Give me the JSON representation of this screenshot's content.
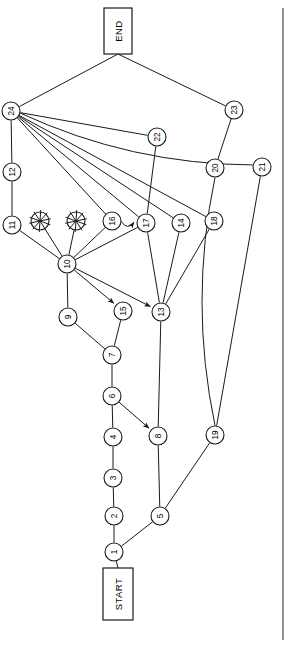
{
  "figure": {
    "type": "directed-graph-flowchart",
    "orientation": "rotated-90-ccw",
    "background": "#ffffff",
    "stroke_color": "#1a1a1a",
    "width": 291,
    "height": 645
  },
  "terminals": {
    "start": {
      "label": "START",
      "x": 118,
      "y": 594,
      "w": 30,
      "h": 52
    },
    "end": {
      "label": "END",
      "x": 118,
      "y": 31,
      "w": 28,
      "h": 46
    }
  },
  "nodes": [
    {
      "id": "1",
      "label": "1",
      "x": 114,
      "y": 552,
      "r": 9
    },
    {
      "id": "2",
      "label": "2",
      "x": 114,
      "y": 516,
      "r": 9
    },
    {
      "id": "3",
      "label": "3",
      "x": 113,
      "y": 478,
      "r": 9
    },
    {
      "id": "4",
      "label": "4",
      "x": 113,
      "y": 437,
      "r": 9
    },
    {
      "id": "5",
      "label": "5",
      "x": 160,
      "y": 516,
      "r": 9
    },
    {
      "id": "6",
      "label": "6",
      "x": 112,
      "y": 396,
      "r": 9
    },
    {
      "id": "7",
      "label": "7",
      "x": 112,
      "y": 355,
      "r": 9
    },
    {
      "id": "8",
      "label": "8",
      "x": 158,
      "y": 436,
      "r": 9
    },
    {
      "id": "9",
      "label": "9",
      "x": 68,
      "y": 317,
      "r": 9
    },
    {
      "id": "10",
      "label": "10",
      "x": 67,
      "y": 264,
      "r": 9
    },
    {
      "id": "11",
      "label": "11",
      "x": 12,
      "y": 225,
      "r": 9
    },
    {
      "id": "12",
      "label": "12",
      "x": 12,
      "y": 172,
      "r": 9
    },
    {
      "id": "13",
      "label": "13",
      "x": 161,
      "y": 312,
      "r": 9
    },
    {
      "id": "14",
      "label": "14",
      "x": 181,
      "y": 223,
      "r": 9
    },
    {
      "id": "15",
      "label": "15",
      "x": 123,
      "y": 311,
      "r": 9
    },
    {
      "id": "16",
      "label": "16",
      "x": 112,
      "y": 221,
      "r": 9
    },
    {
      "id": "17",
      "label": "17",
      "x": 146,
      "y": 223,
      "r": 9
    },
    {
      "id": "18",
      "label": "18",
      "x": 214,
      "y": 221,
      "r": 9
    },
    {
      "id": "19",
      "label": "19",
      "x": 215,
      "y": 435,
      "r": 9
    },
    {
      "id": "20",
      "label": "20",
      "x": 215,
      "y": 168,
      "r": 9
    },
    {
      "id": "21",
      "label": "21",
      "x": 262,
      "y": 167,
      "r": 9
    },
    {
      "id": "22",
      "label": "22",
      "x": 157,
      "y": 137,
      "r": 9
    },
    {
      "id": "23",
      "label": "23",
      "x": 234,
      "y": 110,
      "r": 9
    },
    {
      "id": "24",
      "label": "24",
      "x": 11,
      "y": 111,
      "r": 9
    },
    {
      "id": "u1",
      "label": "",
      "x": 40,
      "y": 221,
      "r": 9,
      "obscured": true
    },
    {
      "id": "u2",
      "label": "",
      "x": 76,
      "y": 221,
      "r": 9,
      "obscured": true
    }
  ],
  "edges": [
    {
      "from": "START",
      "to": "1",
      "type": "line"
    },
    {
      "from": "1",
      "to": "2",
      "type": "line"
    },
    {
      "from": "2",
      "to": "3",
      "type": "line"
    },
    {
      "from": "3",
      "to": "4",
      "type": "line"
    },
    {
      "from": "4",
      "to": "6",
      "type": "line"
    },
    {
      "from": "6",
      "to": "7",
      "type": "line"
    },
    {
      "from": "6",
      "to": "8",
      "type": "arrow"
    },
    {
      "from": "1",
      "to": "5",
      "type": "line"
    },
    {
      "from": "5",
      "to": "8",
      "type": "line"
    },
    {
      "from": "5",
      "to": "19",
      "type": "line"
    },
    {
      "from": "7",
      "to": "9",
      "type": "line"
    },
    {
      "from": "7",
      "to": "15",
      "type": "line"
    },
    {
      "from": "9",
      "to": "10",
      "type": "line"
    },
    {
      "from": "8",
      "to": "13",
      "type": "line"
    },
    {
      "from": "10",
      "to": "11",
      "type": "line"
    },
    {
      "from": "10",
      "to": "u1",
      "type": "line"
    },
    {
      "from": "10",
      "to": "u2",
      "type": "line"
    },
    {
      "from": "10",
      "to": "16",
      "type": "line"
    },
    {
      "from": "10",
      "to": "17",
      "type": "line"
    },
    {
      "from": "10",
      "to": "15",
      "type": "arrow"
    },
    {
      "from": "10",
      "to": "13",
      "type": "arrow"
    },
    {
      "from": "11",
      "to": "12",
      "type": "line"
    },
    {
      "from": "12",
      "to": "24",
      "type": "line"
    },
    {
      "from": "16",
      "to": "17",
      "type": "arrow-curve"
    },
    {
      "from": "17",
      "to": "13",
      "type": "line"
    },
    {
      "from": "14",
      "to": "13",
      "type": "line"
    },
    {
      "from": "18",
      "to": "13",
      "type": "line"
    },
    {
      "from": "22",
      "to": "17",
      "type": "line"
    },
    {
      "from": "24",
      "to": "22",
      "type": "line"
    },
    {
      "from": "24",
      "to": "16",
      "type": "line"
    },
    {
      "from": "24",
      "to": "17",
      "type": "line"
    },
    {
      "from": "24",
      "to": "14",
      "type": "line"
    },
    {
      "from": "24",
      "to": "18",
      "type": "line"
    },
    {
      "from": "24",
      "to": "21",
      "type": "curve"
    },
    {
      "from": "24",
      "to": "END",
      "type": "line"
    },
    {
      "from": "23",
      "to": "END",
      "type": "line"
    },
    {
      "from": "23",
      "to": "20",
      "type": "line"
    },
    {
      "from": "20",
      "to": "19",
      "type": "curve"
    },
    {
      "from": "21",
      "to": "19",
      "type": "line"
    }
  ],
  "frame": {
    "right_border_x": 283,
    "right_border_y1": 8,
    "right_border_y2": 640
  }
}
